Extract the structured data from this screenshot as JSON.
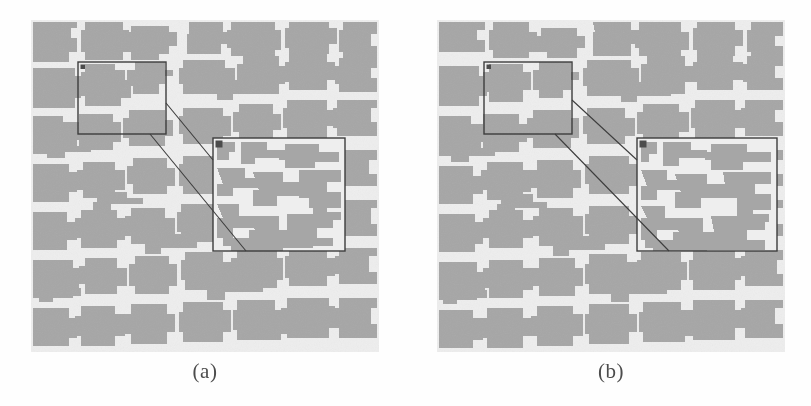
{
  "figure": {
    "kind": "side-by-side-image-comparison",
    "background_color": "#ffffff",
    "width": 811,
    "height": 406
  },
  "panels": [
    {
      "id": "panel-a",
      "caption": "(a)",
      "x": 31,
      "y": 20,
      "width": 348,
      "height": 332,
      "content": "superpixel segmentation map",
      "region_fill_color": "#a6a6a6",
      "boundary_color": "#efefef",
      "background_color": "#e9e9e9",
      "source_box": {
        "x": 47,
        "y": 42,
        "width": 88,
        "height": 72,
        "stroke": "#3a3a3a"
      },
      "zoom_box": {
        "x": 182,
        "y": 118,
        "width": 132,
        "height": 113,
        "stroke": "#3a3a3a"
      },
      "marker_color": "#4a4a4a",
      "connector_color": "#3a3a3a",
      "magnification": "zoomed detail of boxed region"
    },
    {
      "id": "panel-b",
      "caption": "(b)",
      "x": 437,
      "y": 20,
      "width": 348,
      "height": 332,
      "content": "superpixel segmentation map",
      "region_fill_color": "#a6a6a6",
      "boundary_color": "#efefef",
      "background_color": "#e9e9e9",
      "source_box": {
        "x": 47,
        "y": 42,
        "width": 88,
        "height": 72,
        "stroke": "#3a3a3a"
      },
      "zoom_box": {
        "x": 200,
        "y": 118,
        "width": 140,
        "height": 113,
        "stroke": "#3a3a3a"
      },
      "marker_color": "#4a4a4a",
      "connector_color": "#3a3a3a",
      "magnification": "zoomed detail of boxed region"
    }
  ],
  "captions": {
    "a": "(a)",
    "b": "(b)"
  },
  "colors": {
    "page_background": "#ffffff",
    "panel_background": "#e9e9e9",
    "segment_fill": "#a6a6a6",
    "segment_boundary": "#efefef",
    "box_stroke": "#3a3a3a",
    "caption_text": "#4a4a4a"
  }
}
